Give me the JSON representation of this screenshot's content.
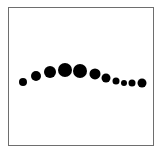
{
  "diagram": {
    "type": "dot-sequence",
    "dot_color": "#000000",
    "frame_color": "#6e6e6e",
    "background_color": "#ffffff",
    "dots": [
      {
        "index": 1,
        "relative_size": 0.57,
        "relative_height": 0.0
      },
      {
        "index": 2,
        "relative_size": 0.71,
        "relative_height": 0.5
      },
      {
        "index": 3,
        "relative_size": 0.86,
        "relative_height": 0.83
      },
      {
        "index": 4,
        "relative_size": 1.0,
        "relative_height": 1.0
      },
      {
        "index": 5,
        "relative_size": 1.0,
        "relative_height": 0.92
      },
      {
        "index": 6,
        "relative_size": 0.79,
        "relative_height": 0.67
      },
      {
        "index": 7,
        "relative_size": 0.64,
        "relative_height": 0.33
      },
      {
        "index": 8,
        "relative_size": 0.5,
        "relative_height": 0.08
      },
      {
        "index": 9,
        "relative_size": 0.43,
        "relative_height": -0.08
      },
      {
        "index": 10,
        "relative_size": 0.5,
        "relative_height": -0.08
      },
      {
        "index": 11,
        "relative_size": 0.64,
        "relative_height": -0.08
      }
    ]
  }
}
